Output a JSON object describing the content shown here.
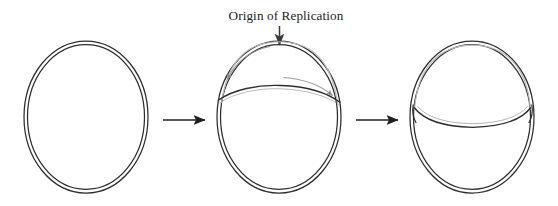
{
  "figure": {
    "label": {
      "text": "Origin of Replication",
      "x": 286,
      "y": 20
    },
    "colors": {
      "dna_stroke": "#2e2e2e",
      "dna_stroke_light": "#b9b9b9",
      "arrow_stroke": "#1f1f1f",
      "pointer_stroke": "#444444",
      "background": "#ffffff",
      "text": "#1c1c1c"
    },
    "stages": [
      {
        "name": "stage-1-unreplicated-circle",
        "order": 1,
        "caption": "",
        "center_x": 86,
        "center_y": 117,
        "radius_x": 62,
        "radius_y": 76,
        "has_bubble": false,
        "bubble_size": 0
      },
      {
        "name": "stage-2-early-replication-bubble",
        "order": 2,
        "caption": "",
        "center_x": 279,
        "center_y": 117,
        "radius_x": 62,
        "radius_y": 76,
        "has_bubble": true,
        "bubble_size": 1
      },
      {
        "name": "stage-3-expanded-replication-bubble",
        "order": 3,
        "caption": "",
        "center_x": 472,
        "center_y": 117,
        "radius_x": 62,
        "radius_y": 76,
        "has_bubble": true,
        "bubble_size": 2
      }
    ],
    "process_arrows": [
      {
        "name": "process-arrow-1",
        "x1": 163,
        "x2": 207,
        "y": 120
      },
      {
        "name": "process-arrow-2",
        "x1": 356,
        "x2": 400,
        "y": 120
      }
    ],
    "origin_pointer": {
      "name": "origin-pointer-arrow",
      "x": 279,
      "y1": 26,
      "y2": 45
    },
    "fork_arrows": [
      {
        "name": "replication-fork-arrow-left",
        "direction": "counterclockwise"
      },
      {
        "name": "replication-fork-arrow-right",
        "direction": "clockwise"
      }
    ]
  }
}
